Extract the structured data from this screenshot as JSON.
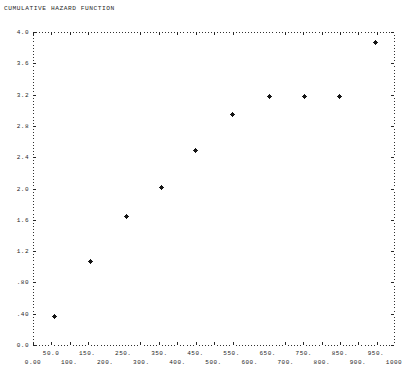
{
  "title": "CUMULATIVE HAZARD FUNCTION",
  "chart_data": {
    "type": "scatter",
    "title": "CUMULATIVE HAZARD FUNCTION",
    "xlabel": "",
    "ylabel": "",
    "xlim": [
      0,
      1000
    ],
    "ylim": [
      0.0,
      4.0
    ],
    "grid": false,
    "legend": null,
    "marker": "plus",
    "marker_color": "#111111",
    "frame_color": "#303030",
    "background": "#ffffff",
    "x": [
      60,
      160,
      258,
      357,
      451,
      554,
      656,
      753,
      850,
      949
    ],
    "y": [
      0.36,
      1.07,
      1.64,
      2.01,
      2.48,
      2.95,
      3.18,
      3.18,
      3.18,
      3.87
    ],
    "yticks_major": [
      "0.0",
      ".40",
      ".80",
      "1.2",
      "1.6",
      "2.0",
      "2.4",
      "2.8",
      "3.2",
      "3.6",
      "4.0"
    ],
    "ytick_values": [
      0.0,
      0.4,
      0.8,
      1.2,
      1.6,
      2.0,
      2.4,
      2.8,
      3.2,
      3.6,
      4.0
    ],
    "xticks_upper": [
      "50.0",
      "150.",
      "250.",
      "350.",
      "450.",
      "550.",
      "650.",
      "750.",
      "850.",
      "950."
    ],
    "xtick_upper_values": [
      50,
      150,
      250,
      350,
      450,
      550,
      650,
      750,
      850,
      950
    ],
    "xticks_lower": [
      "0.00",
      "100.",
      "200.",
      "300.",
      "400.",
      "500.",
      "600.",
      "700.",
      "800.",
      "900.",
      "1000"
    ],
    "xtick_lower_values": [
      0,
      100,
      200,
      300,
      400,
      500,
      600,
      700,
      800,
      900,
      1000
    ]
  }
}
